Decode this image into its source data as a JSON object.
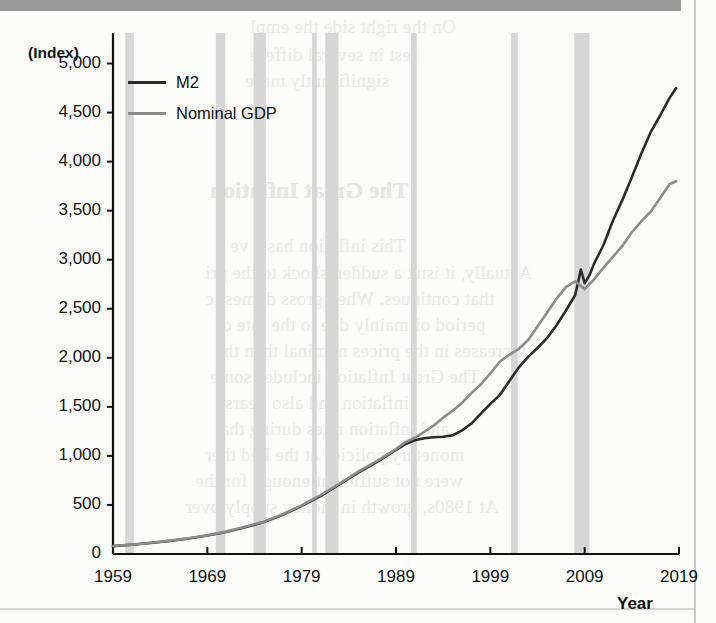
{
  "page": {
    "background_color": "#fbfbfa",
    "top_bar_color": "#9a9a9a",
    "bleed_texts": [
      "On the right side the empl",
      "rest in several differe",
      "significantly more",
      "The Great Inflation",
      "The Great Inflation",
      "This inflation has a ve",
      "Actually, it isn't a sudden shock to the pri",
      "that continues. When gross domestic",
      "period of mainly due to the rate of",
      "increases in the prices nominal than the",
      "The Great Inflation includes some",
      "inflation and also years",
      "and inflation rates during that",
      "monetary policies at the Fed ther",
      "were not sufficient enough for the",
      "At 1980s, growth in money supply over"
    ]
  },
  "chart_data": {
    "type": "line",
    "title": "",
    "xlabel": "Year",
    "ylabel": "(Index)",
    "y_unit_label": "(Index)",
    "xlim": [
      1959,
      2019
    ],
    "ylim": [
      0,
      5250
    ],
    "yticks": [
      0,
      500,
      1000,
      1500,
      2000,
      2500,
      3000,
      3500,
      4000,
      4500,
      5000
    ],
    "ytick_labels": [
      "0",
      "500",
      "1,000",
      "1,500",
      "2,000",
      "2,500",
      "3,000",
      "3,500",
      "4,000",
      "4,500",
      "5,000"
    ],
    "xticks": [
      1959,
      1969,
      1979,
      1989,
      1999,
      2009,
      2019
    ],
    "xtick_labels": [
      "1959",
      "1969",
      "1979",
      "1989",
      "1999",
      "2009",
      "2019"
    ],
    "grid": false,
    "legend_position": "top-left",
    "series": [
      {
        "name": "M2",
        "color": "#2b2b2b",
        "width": 2.6,
        "x": [
          1959,
          1961,
          1963,
          1965,
          1967,
          1969,
          1971,
          1973,
          1975,
          1977,
          1979,
          1981,
          1983,
          1985,
          1987,
          1989,
          1990,
          1991,
          1992,
          1993,
          1994,
          1995,
          1996,
          1997,
          1998,
          1999,
          2000,
          2001,
          2002,
          2003,
          2004,
          2005,
          2006,
          2007,
          2008,
          2008.6,
          2009,
          2009.5,
          2010,
          2011,
          2012,
          2013,
          2014,
          2015,
          2016,
          2017,
          2018,
          2018.7
        ],
        "y": [
          80,
          95,
          112,
          133,
          158,
          188,
          225,
          272,
          325,
          400,
          490,
          590,
          710,
          830,
          940,
          1060,
          1120,
          1160,
          1180,
          1190,
          1195,
          1210,
          1260,
          1330,
          1430,
          1530,
          1620,
          1760,
          1900,
          2010,
          2100,
          2200,
          2330,
          2480,
          2640,
          2900,
          2760,
          2840,
          2960,
          3150,
          3400,
          3610,
          3840,
          4080,
          4300,
          4470,
          4650,
          4750
        ]
      },
      {
        "name": "Nominal GDP",
        "color": "#8b8b8b",
        "width": 2.6,
        "x": [
          1959,
          1961,
          1963,
          1965,
          1967,
          1969,
          1971,
          1973,
          1975,
          1977,
          1979,
          1981,
          1983,
          1985,
          1987,
          1989,
          1990,
          1991,
          1992,
          1993,
          1994,
          1995,
          1996,
          1997,
          1998,
          1999,
          2000,
          2001,
          2002,
          2003,
          2004,
          2005,
          2006,
          2007,
          2008,
          2009,
          2010,
          2011,
          2012,
          2013,
          2014,
          2015,
          2016,
          2017,
          2018,
          2018.7
        ],
        "y": [
          82,
          96,
          114,
          136,
          160,
          192,
          228,
          278,
          330,
          405,
          495,
          600,
          715,
          840,
          950,
          1070,
          1140,
          1185,
          1245,
          1310,
          1390,
          1460,
          1540,
          1640,
          1730,
          1840,
          1960,
          2030,
          2090,
          2180,
          2320,
          2460,
          2600,
          2720,
          2780,
          2700,
          2800,
          2920,
          3030,
          3140,
          3280,
          3390,
          3490,
          3630,
          3770,
          3800
        ]
      }
    ],
    "recession_bands": [
      {
        "start": 1960.3,
        "end": 1961.2
      },
      {
        "start": 1969.9,
        "end": 1970.9
      },
      {
        "start": 1973.9,
        "end": 1975.2
      },
      {
        "start": 1980.1,
        "end": 1980.6
      },
      {
        "start": 1981.5,
        "end": 1982.9
      },
      {
        "start": 1990.6,
        "end": 1991.2
      },
      {
        "start": 2001.2,
        "end": 2001.9
      },
      {
        "start": 2007.9,
        "end": 2009.5
      }
    ],
    "recession_band_color": "#d6d6d6",
    "annotations": []
  },
  "legend": {
    "items": [
      {
        "label": "M2",
        "color": "#2b2b2b"
      },
      {
        "label": "Nominal GDP",
        "color": "#8b8b8b"
      }
    ]
  }
}
